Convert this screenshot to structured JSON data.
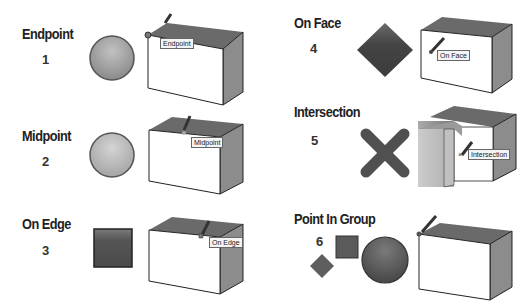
{
  "colors": {
    "title_text": "#222222",
    "box_top": "#6a6a6a",
    "box_side": "#8c8c8c",
    "box_front": "#ffffff",
    "marker_dark": "#444444",
    "marker_mid": "#6e6e6e",
    "marker_light": "#b4b4b4"
  },
  "panels": [
    {
      "id": "endpoint",
      "title": "Endpoint",
      "number": "1",
      "marker": "sphere",
      "tooltip": "Endpoint"
    },
    {
      "id": "midpoint",
      "title": "Midpoint",
      "number": "2",
      "marker": "sphere",
      "tooltip": "Midpoint"
    },
    {
      "id": "on-edge",
      "title": "On Edge",
      "number": "3",
      "marker": "square",
      "tooltip": "On Edge"
    },
    {
      "id": "on-face",
      "title": "On Face",
      "number": "4",
      "marker": "diamond",
      "tooltip": "On Face"
    },
    {
      "id": "intersection",
      "title": "Intersection",
      "number": "5",
      "marker": "x-cross",
      "tooltip": "Intersection"
    },
    {
      "id": "point-in-group",
      "title": "Point In Group",
      "number": "6",
      "marker": "diamond-square-sphere",
      "tooltip": ""
    }
  ]
}
